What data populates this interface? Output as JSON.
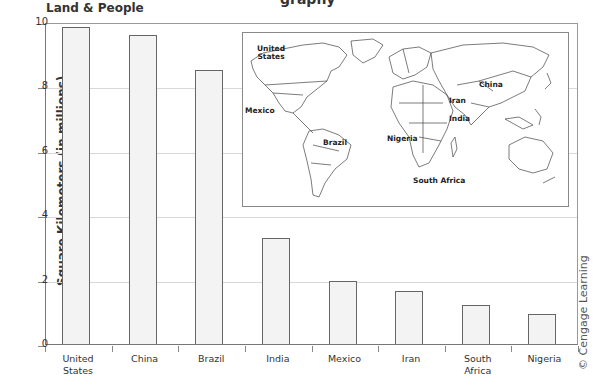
{
  "header": {
    "cut_title": "graphy",
    "subtitle": "Land & People"
  },
  "credit": "© Cengage Learning",
  "chart_data": {
    "type": "bar",
    "title": "Land & People",
    "xlabel": "",
    "ylabel": "Square Kilometers (in millions)",
    "categories": [
      "United States",
      "China",
      "Brazil",
      "India",
      "Mexico",
      "Iran",
      "South Africa",
      "Nigeria"
    ],
    "values": [
      9.83,
      9.6,
      8.51,
      3.29,
      1.97,
      1.65,
      1.22,
      0.92
    ],
    "ylim": [
      0,
      10
    ],
    "yticks": [
      0,
      2,
      4,
      6,
      8,
      10
    ],
    "grid": true,
    "legend": null,
    "bar_fill": "#f3f3f3",
    "bar_edge": "#666666",
    "inset": {
      "type": "world-map",
      "labels": [
        "United States",
        "Mexico",
        "Brazil",
        "Nigeria",
        "South Africa",
        "Iran",
        "India",
        "China"
      ]
    }
  },
  "axis": {
    "yticks": [
      "0",
      "2",
      "4",
      "6",
      "8",
      "10"
    ],
    "xlabels": [
      [
        "United",
        "States"
      ],
      [
        "China",
        ""
      ],
      [
        "Brazil",
        ""
      ],
      [
        "India",
        ""
      ],
      [
        "Mexico",
        ""
      ],
      [
        "Iran",
        ""
      ],
      [
        "South",
        "Africa"
      ],
      [
        "Nigeria",
        ""
      ]
    ]
  },
  "map_labels": {
    "us1": "United",
    "us2": "States",
    "mexico": "Mexico",
    "brazil": "Brazil",
    "nigeria": "Nigeria",
    "south_africa": "South Africa",
    "iran": "Iran",
    "india": "India",
    "china": "China"
  }
}
